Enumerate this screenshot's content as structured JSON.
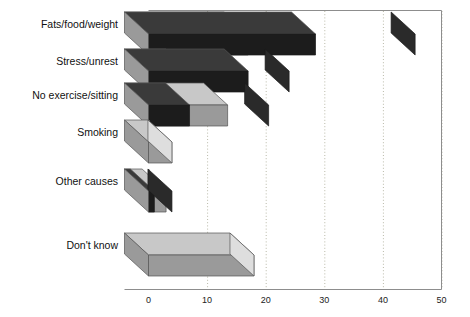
{
  "chart_data": {
    "type": "bar",
    "orientation": "horizontal",
    "style": "3d-stacked-horizontal-bar",
    "title": "",
    "subtitle": "",
    "xlabel": "",
    "ylabel": "",
    "xlim": [
      0,
      50
    ],
    "xticks": [
      0,
      10,
      20,
      30,
      40,
      50
    ],
    "xtick_labels": [
      "0",
      "10",
      "20",
      "30",
      "40",
      "50"
    ],
    "grid": "vertical-dotted",
    "legend": "none",
    "categories": [
      "Fats/food/weight",
      "Stress/unrest",
      "No exercise/sitting",
      "Smoking",
      "Other causes",
      "Don't know"
    ],
    "series": [
      {
        "name": "segment-1",
        "color": "#9a9a9a",
        "values": [
          17,
          7,
          13.5,
          4,
          3,
          18
        ]
      },
      {
        "name": "segment-2",
        "color": "#1c1c1c",
        "values": [
          28.5,
          17,
          7,
          0,
          1,
          0
        ]
      }
    ],
    "totals": [
      45.5,
      24,
      20.5,
      4,
      4,
      18
    ]
  },
  "axis": {
    "tick_labels": [
      "0",
      "10",
      "20",
      "30",
      "40",
      "50"
    ],
    "category_labels": [
      "Fats/food/weight",
      "Stress/unrest",
      "No exercise/sitting",
      "Smoking",
      "Other causes",
      "Don't know"
    ]
  },
  "colors": {
    "segment_light": "#9a9a9a",
    "segment_light_top": "#c8c8c8",
    "segment_light_side": "#dedede",
    "segment_dark": "#1c1c1c",
    "segment_dark_top": "#3a3a3a",
    "segment_dark_side": "#2a2a2a",
    "grid": "#b9b9a8",
    "frame": "#8d8d8d",
    "text": "#111111",
    "background": "#ffffff"
  }
}
